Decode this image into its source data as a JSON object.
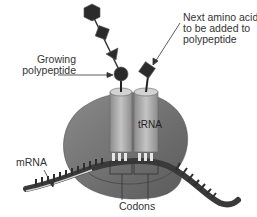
{
  "diagram": {
    "labels": {
      "growing_line1": "Growing",
      "growing_line2": "polypeptide",
      "next_line1": "Next amino acid",
      "next_line2": "to be added to",
      "next_line3": "polypeptide",
      "trna": "tRNA",
      "mrna": "mRNA",
      "codons": "Codons"
    },
    "components": [
      {
        "name": "ribosome",
        "shape": "blob"
      },
      {
        "name": "tRNA",
        "count": 2,
        "shape": "cylinder"
      },
      {
        "name": "mRNA",
        "shape": "ribbon"
      },
      {
        "name": "amino acids",
        "shapes": [
          "hexagon",
          "square",
          "triangle",
          "circle",
          "diamond"
        ]
      }
    ],
    "colors": {
      "ribosome": "#6e6e6e",
      "trna": "#a8a8a8",
      "mrna": "#3a3a3a",
      "amino_acid": "#2b2b2b",
      "text": "#333333"
    }
  }
}
